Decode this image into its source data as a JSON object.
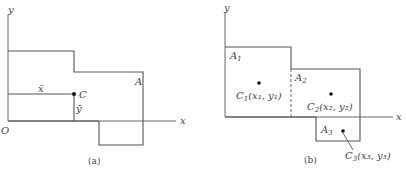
{
  "figure_a": {
    "caption": "(a)",
    "x_axis_label": "x",
    "y_axis_label": "y",
    "origin_label": "O",
    "area_label": "A",
    "centroid_label": "C",
    "xbar_label": "x̄",
    "ybar_label": "ȳ"
  },
  "figure_b": {
    "caption": "(b)",
    "x_axis_label": "x",
    "y_axis_label": "y",
    "areas": [
      {
        "name": "A",
        "sub": "1"
      },
      {
        "name": "A",
        "sub": "2"
      },
      {
        "name": "A",
        "sub": "3"
      }
    ],
    "centroids": [
      {
        "name": "C",
        "sub": "1",
        "coord": "(x₁, y₁)"
      },
      {
        "name": "C",
        "sub": "2",
        "coord": "(x₂, y₂)"
      },
      {
        "name": "C",
        "sub": "3",
        "coord": "(x₃, y₃)"
      }
    ]
  }
}
